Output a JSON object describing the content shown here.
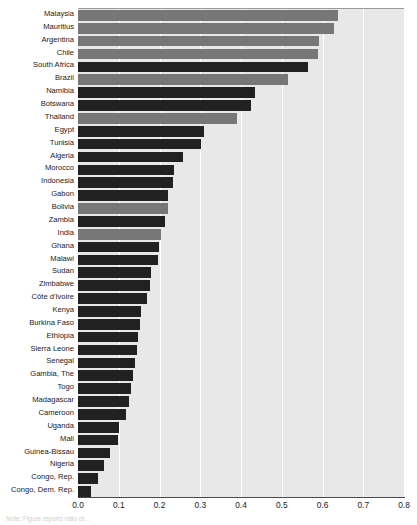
{
  "chart_data": {
    "type": "bar",
    "orientation": "horizontal",
    "title": "",
    "subtitle": "",
    "xlabel": "",
    "ylabel": "",
    "xlim": [
      0.0,
      0.8
    ],
    "xticks": [
      "0.0",
      "0.1",
      "0.2",
      "0.3",
      "0.4",
      "0.5",
      "0.6",
      "0.7",
      "0.8"
    ],
    "xtick_values": [
      0.0,
      0.1,
      0.2,
      0.3,
      0.4,
      0.5,
      0.6,
      0.7,
      0.8
    ],
    "grid": "vertical-white-gridlines",
    "legend": "none",
    "series_groups": [
      {
        "name": "group-gray",
        "color": "#777777"
      },
      {
        "name": "group-dark",
        "color": "#212121"
      }
    ],
    "panel_background": "#e8e8e8",
    "categories": [
      "Malaysia",
      "Mauritius",
      "Argentina",
      "Chile",
      "South Africa",
      "Brazil",
      "Namibia",
      "Botswana",
      "Thailand",
      "Egypt",
      "Tunisia",
      "Algeria",
      "Morocco",
      "Indonesia",
      "Gabon",
      "Bolivia",
      "Zambia",
      "India",
      "Ghana",
      "Malawi",
      "Sudan",
      "Zimbabwe",
      "Côte d'Ivoire",
      "Kenya",
      "Burkina Faso",
      "Ethiopia",
      "Sierra Leone",
      "Senegal",
      "Gambia, The",
      "Togo",
      "Madagascar",
      "Cameroon",
      "Uganda",
      "Mali",
      "Guinea-Bissau",
      "Nigeria",
      "Congo, Rep.",
      "Congo, Dem. Rep."
    ],
    "values": [
      0.638,
      0.627,
      0.592,
      0.588,
      0.565,
      0.515,
      0.435,
      0.424,
      0.39,
      0.31,
      0.303,
      0.257,
      0.235,
      0.232,
      0.222,
      0.22,
      0.213,
      0.204,
      0.198,
      0.196,
      0.178,
      0.176,
      0.17,
      0.155,
      0.152,
      0.148,
      0.144,
      0.14,
      0.135,
      0.13,
      0.124,
      0.118,
      0.1,
      0.098,
      0.078,
      0.065,
      0.05,
      0.032
    ],
    "bar_colors": [
      "gray",
      "gray",
      "gray",
      "gray",
      "dark",
      "gray",
      "dark",
      "dark",
      "gray",
      "dark",
      "dark",
      "dark",
      "dark",
      "dark",
      "dark",
      "gray",
      "dark",
      "gray",
      "dark",
      "dark",
      "dark",
      "dark",
      "dark",
      "dark",
      "dark",
      "dark",
      "dark",
      "dark",
      "dark",
      "dark",
      "dark",
      "dark",
      "dark",
      "dark",
      "dark",
      "dark",
      "dark",
      "dark"
    ]
  },
  "note": {
    "text": "Note: Figure reports ratio of... "
  }
}
